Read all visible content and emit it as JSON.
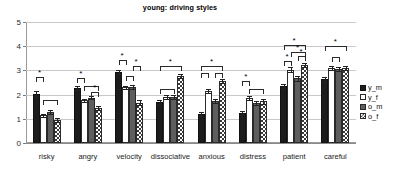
{
  "chart_data": {
    "type": "bar",
    "title": "young: driving styles",
    "xlabel": "",
    "ylabel": "",
    "ylim": [
      0,
      5
    ],
    "yticks": [
      0,
      1,
      2,
      3,
      4,
      5
    ],
    "grid": true,
    "legend_position": "right",
    "categories": [
      "risky",
      "angry",
      "velocity",
      "dissociative",
      "anxious",
      "distress",
      "patient",
      "careful"
    ],
    "series": [
      {
        "name": "y_m",
        "style": "solid-black",
        "values": [
          2.03,
          2.26,
          2.93,
          1.7,
          1.2,
          1.26,
          2.34,
          2.63
        ],
        "errors": [
          0.12,
          0.09,
          0.09,
          0.09,
          0.07,
          0.08,
          0.1,
          0.09
        ]
      },
      {
        "name": "y_f",
        "style": "white-outline",
        "values": [
          1.14,
          1.76,
          2.3,
          1.9,
          2.15,
          1.87,
          3.03,
          3.11
        ],
        "errors": [
          0.07,
          0.07,
          0.07,
          0.08,
          0.07,
          0.09,
          0.09,
          0.08
        ]
      },
      {
        "name": "o_m",
        "style": "gray",
        "values": [
          1.28,
          1.87,
          2.3,
          1.9,
          1.75,
          1.67,
          2.67,
          3.07
        ],
        "errors": [
          0.08,
          0.07,
          0.08,
          0.07,
          0.08,
          0.08,
          0.09,
          0.08
        ]
      },
      {
        "name": "o_f",
        "style": "checkered",
        "values": [
          0.95,
          1.44,
          1.67,
          2.77,
          2.58,
          1.72,
          3.23,
          3.11
        ],
        "errors": [
          0.07,
          0.08,
          0.09,
          0.08,
          0.08,
          0.09,
          0.09,
          0.08
        ]
      }
    ],
    "significance_marker": "*",
    "significance_brackets": [
      {
        "category": "risky",
        "from": 0,
        "to": 1,
        "y": 2.72,
        "star": true
      },
      {
        "category": "risky",
        "from": 1,
        "to": 3,
        "y": 1.76,
        "star": false
      },
      {
        "category": "angry",
        "from": 0,
        "to": 1,
        "y": 2.68,
        "star": true
      },
      {
        "category": "angry",
        "from": 1,
        "to": 3,
        "y": 2.37,
        "star": false
      },
      {
        "category": "angry",
        "from": 2,
        "to": 3,
        "y": 2.12,
        "star": true
      },
      {
        "category": "velocity",
        "from": 0,
        "to": 1,
        "y": 3.41,
        "star": true
      },
      {
        "category": "velocity",
        "from": 1,
        "to": 2,
        "y": 2.75,
        "star": false
      },
      {
        "category": "velocity",
        "from": 2,
        "to": 3,
        "y": 3.2,
        "star": true
      },
      {
        "category": "dissociative",
        "from": 0,
        "to": 3,
        "y": 3.2,
        "star": true
      },
      {
        "category": "dissociative",
        "from": 0,
        "to": 2,
        "y": 2.22,
        "star": false
      },
      {
        "category": "anxious",
        "from": 0,
        "to": 3,
        "y": 3.17,
        "star": true
      },
      {
        "category": "anxious",
        "from": 0,
        "to": 1,
        "y": 2.88,
        "star": false
      },
      {
        "category": "anxious",
        "from": 2,
        "to": 3,
        "y": 2.88,
        "star": false
      },
      {
        "category": "distress",
        "from": 0,
        "to": 1,
        "y": 2.58,
        "star": true
      },
      {
        "category": "distress",
        "from": 1,
        "to": 3,
        "y": 2.23,
        "star": false
      },
      {
        "category": "patient",
        "from": 0,
        "to": 3,
        "y": 4.06,
        "star": true
      },
      {
        "category": "patient",
        "from": 1,
        "to": 3,
        "y": 3.76,
        "star": true
      },
      {
        "category": "patient",
        "from": 0,
        "to": 1,
        "y": 3.38,
        "star": true
      },
      {
        "category": "patient",
        "from": 2,
        "to": 3,
        "y": 3.58,
        "star": true
      },
      {
        "category": "careful",
        "from": 0,
        "to": 3,
        "y": 3.99,
        "star": true
      },
      {
        "category": "careful",
        "from": 1,
        "to": 2,
        "y": 3.55,
        "star": false
      }
    ]
  },
  "legend": {
    "items": [
      {
        "label": "y_m",
        "style": "solid-black"
      },
      {
        "label": "y_f",
        "style": "white-outline"
      },
      {
        "label": "o_m",
        "style": "gray"
      },
      {
        "label": "o_f",
        "style": "checkered"
      }
    ]
  }
}
